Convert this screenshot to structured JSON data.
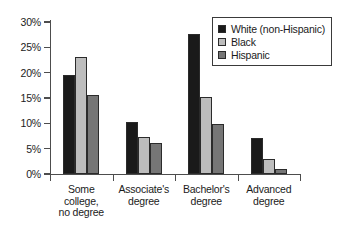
{
  "chart_data": {
    "type": "bar",
    "title": "",
    "subtitle": "",
    "xlabel": "",
    "ylabel": "",
    "categories": [
      "Some\ncollege,\nno degree",
      "Associate's\ndegree",
      "Bachelor's\ndegree",
      "Advanced\ndegree"
    ],
    "series": [
      {
        "name": "White (non-Hispanic)",
        "color": "#1a1a1a",
        "values": [
          19.5,
          10.2,
          27.6,
          7.1
        ]
      },
      {
        "name": "Black",
        "color": "#bdbdbd",
        "values": [
          23.0,
          7.4,
          15.2,
          2.9
        ]
      },
      {
        "name": "Hispanic",
        "color": "#767676",
        "values": [
          15.5,
          6.2,
          9.8,
          0.9
        ]
      }
    ],
    "ylim": [
      0,
      30
    ],
    "y_ticks": [
      0,
      5,
      10,
      15,
      20,
      25,
      30
    ],
    "y_tick_labels": [
      "0%",
      "5%",
      "10%",
      "15%",
      "20%",
      "25%",
      "30%"
    ],
    "grid": false,
    "legend_position": "top-right",
    "axis_color": "#4d4d4d",
    "bar_edge_color": "#2b2b2b",
    "background": "#ffffff"
  },
  "legend": {
    "items": [
      {
        "label": "White (non-Hispanic)",
        "color": "#1a1a1a"
      },
      {
        "label": "Black",
        "color": "#bdbdbd"
      },
      {
        "label": "Hispanic",
        "color": "#767676"
      }
    ]
  }
}
